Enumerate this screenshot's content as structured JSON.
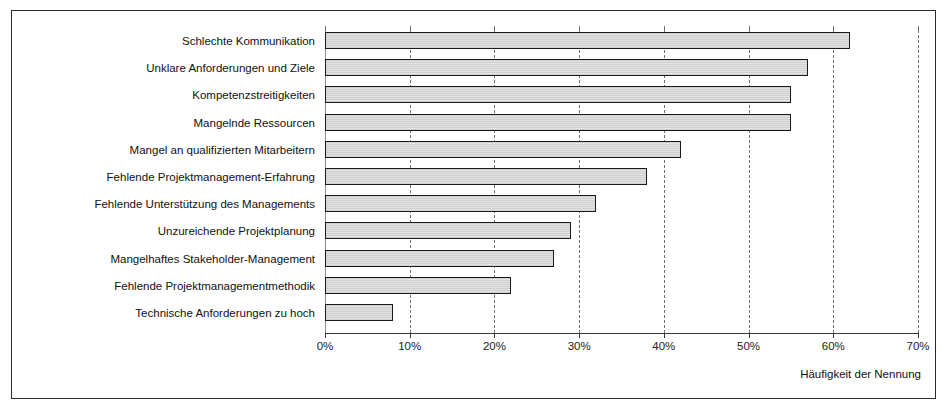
{
  "chart_data": {
    "type": "bar",
    "orientation": "horizontal",
    "title": "",
    "subtitle": "",
    "xlabel": "Häufigkeit der Nennung",
    "ylabel": "",
    "xlim": [
      0,
      70
    ],
    "xtick_values": [
      0,
      10,
      20,
      30,
      40,
      50,
      60,
      70
    ],
    "xtick_labels": [
      "0%",
      "10%",
      "20%",
      "30%",
      "40%",
      "50%",
      "60%",
      "70%"
    ],
    "grid": "vertical-dashed",
    "legend": "none",
    "unit": "%",
    "categories": [
      "Schlechte Kommunikation",
      "Unklare Anforderungen und Ziele",
      "Kompetenzstreitigkeiten",
      "Mangelnde Ressourcen",
      "Mangel an qualifizierten Mitarbeitern",
      "Fehlende Projektmanagement-Erfahrung",
      "Fehlende Unterstützung des Managements",
      "Unzureichende Projektplanung",
      "Mangelhaftes Stakeholder-Management",
      "Fehlende Projektmanagementmethodik",
      "Technische Anforderungen zu hoch"
    ],
    "values": [
      62,
      57,
      55,
      55,
      42,
      38,
      32,
      29,
      27,
      22,
      8
    ],
    "bar_fill_color": "#e4e4e4",
    "bar_edge_color": "#1a1a1a",
    "grid_color": "#6f6f6f",
    "axis_color": "#3a3a3a",
    "text_color": "#111111",
    "background_color": "#ffffff"
  },
  "axis": {
    "x_title": "Häufigkeit der Nennung"
  }
}
